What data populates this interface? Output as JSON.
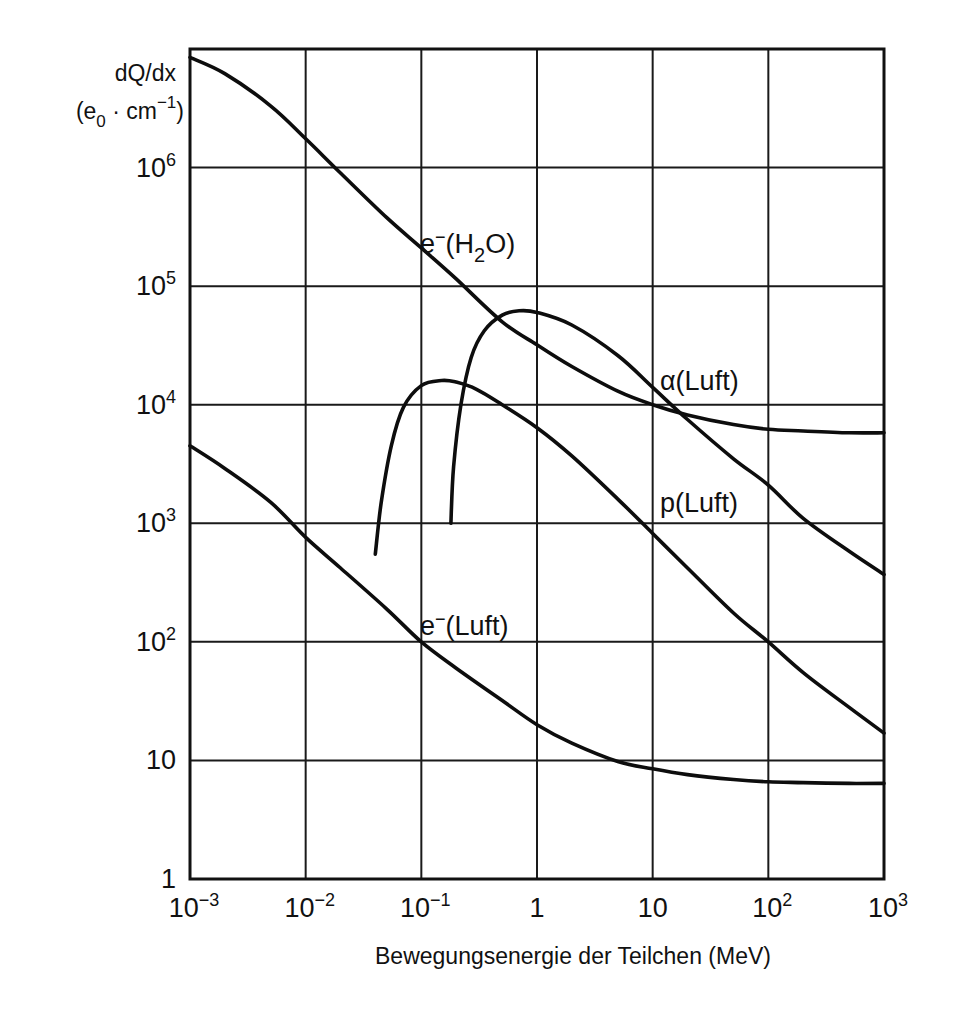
{
  "chart_data": {
    "type": "line",
    "title": "",
    "xlabel": "Bewegungsenergie der Teilchen (MeV)",
    "ylabel_line1": "dQ/dx",
    "ylabel_line2": "(e0 · cm⁻¹)",
    "ylabel": "dQ/dx (e0 · cm^-1)",
    "x_scale": "log",
    "y_scale": "log",
    "xlim": [
      0.001,
      1000
    ],
    "ylim": [
      1,
      10000000
    ],
    "grid": true,
    "legend": "inline labels",
    "x_ticks": [
      {
        "value": 0.001,
        "base": "10",
        "exp": "-3"
      },
      {
        "value": 0.01,
        "base": "10",
        "exp": "-2"
      },
      {
        "value": 0.1,
        "base": "10",
        "exp": "-1"
      },
      {
        "value": 1,
        "base": "1",
        "exp": ""
      },
      {
        "value": 10,
        "base": "10",
        "exp": ""
      },
      {
        "value": 100,
        "base": "10",
        "exp": "2"
      },
      {
        "value": 1000,
        "base": "10",
        "exp": "3"
      }
    ],
    "y_ticks": [
      {
        "value": 1,
        "base": "1",
        "exp": ""
      },
      {
        "value": 10,
        "base": "10",
        "exp": ""
      },
      {
        "value": 100,
        "base": "10",
        "exp": "2"
      },
      {
        "value": 1000,
        "base": "10",
        "exp": "3"
      },
      {
        "value": 10000,
        "base": "10",
        "exp": "4"
      },
      {
        "value": 100000,
        "base": "10",
        "exp": "5"
      },
      {
        "value": 1000000,
        "base": "10",
        "exp": "6"
      }
    ],
    "series": [
      {
        "name": "e⁻(H₂O)",
        "label_main": "e",
        "label_sup": "−",
        "label_rest_a": "(H",
        "label_sub": "2",
        "label_rest_b": "O)",
        "label_pos": {
          "x": 420,
          "y": 253
        },
        "x": [
          0.001,
          0.002,
          0.005,
          0.01,
          0.02,
          0.05,
          0.1,
          0.2,
          0.5,
          1,
          2,
          5,
          10,
          20,
          50,
          100,
          200,
          500,
          1000
        ],
        "y": [
          8500000,
          6200000,
          3300000,
          1750000,
          900000,
          380000,
          210000,
          115000,
          50000,
          32000,
          21000,
          13000,
          10000,
          8200,
          6800,
          6200,
          6000,
          5800,
          5800
        ]
      },
      {
        "name": "α(Luft)",
        "label_main": "α(Luft)",
        "label_pos": {
          "x": 660,
          "y": 390
        },
        "x": [
          0.18,
          0.19,
          0.22,
          0.27,
          0.35,
          0.5,
          0.7,
          1,
          2,
          5,
          10,
          20,
          50,
          100,
          200,
          500,
          1000
        ],
        "y": [
          1000,
          3000,
          10000,
          25000,
          42000,
          57000,
          62000,
          60000,
          47000,
          26000,
          14000,
          7500,
          3500,
          2100,
          1100,
          580,
          370
        ]
      },
      {
        "name": "p(Luft)",
        "label_main": "p(Luft)",
        "label_pos": {
          "x": 660,
          "y": 512
        },
        "x": [
          0.04,
          0.045,
          0.055,
          0.07,
          0.1,
          0.15,
          0.2,
          0.3,
          0.5,
          1,
          2,
          5,
          10,
          20,
          50,
          100,
          200,
          500,
          1000
        ],
        "y": [
          550,
          1500,
          4500,
          9500,
          14500,
          16000,
          15500,
          13500,
          10000,
          6400,
          3700,
          1600,
          820,
          420,
          175,
          100,
          55,
          28,
          17
        ]
      },
      {
        "name": "e⁻(Luft)",
        "label_main": "e",
        "label_sup": "−",
        "label_rest_a": "(Luft)",
        "label_pos": {
          "x": 420,
          "y": 635
        },
        "x": [
          0.001,
          0.002,
          0.005,
          0.01,
          0.02,
          0.05,
          0.1,
          0.2,
          0.5,
          1,
          2,
          5,
          10,
          20,
          50,
          100,
          200,
          500,
          1000
        ],
        "y": [
          4500,
          2900,
          1500,
          760,
          420,
          190,
          100,
          60,
          32,
          20,
          14,
          9.8,
          8.5,
          7.6,
          6.9,
          6.6,
          6.5,
          6.4,
          6.4
        ]
      }
    ]
  },
  "plot_area": {
    "left": 190,
    "right": 884,
    "top": 49,
    "bottom": 879
  },
  "colors": {
    "line": "#0d0d0d",
    "grid": "#1a1a1a",
    "background": "#ffffff"
  }
}
